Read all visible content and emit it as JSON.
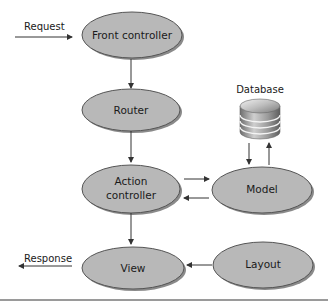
{
  "colors": {
    "node_fill": "#b8b8b8",
    "node_stroke": "#555555",
    "node_shadow": "#8a8a8a",
    "arrow": "#333333",
    "rule": "#9a9a9a"
  },
  "nodes": {
    "front_controller": {
      "label": "Front controller"
    },
    "router": {
      "label": "Router"
    },
    "action_controller": {
      "label_line1": "Action",
      "label_line2": "controller"
    },
    "model": {
      "label": "Model"
    },
    "view": {
      "label": "View"
    },
    "layout": {
      "label": "Layout"
    },
    "database": {
      "label": "Database"
    }
  },
  "edges": {
    "request": {
      "label": "Request"
    },
    "response": {
      "label": "Response"
    }
  }
}
